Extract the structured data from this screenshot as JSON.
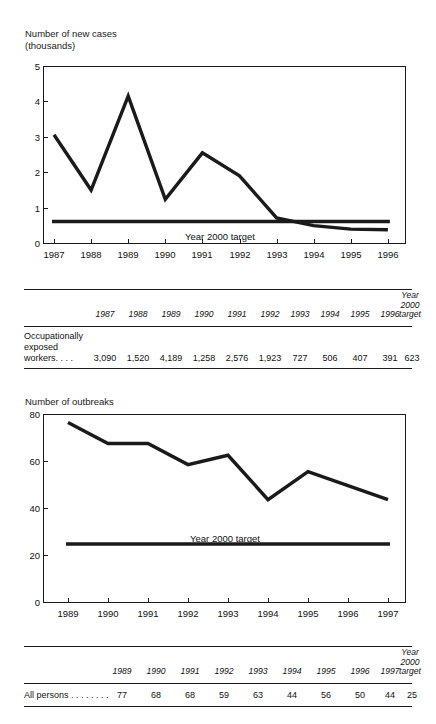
{
  "chart_data": [
    {
      "id": "new-cases",
      "type": "line",
      "title": "Number of new cases\n(thousands)",
      "ylabel": "Number of new cases (thousands)",
      "xlabel": "",
      "ylim": [
        0,
        5
      ],
      "yticks": [
        0,
        1,
        2,
        3,
        4,
        5
      ],
      "ytick_labels": [
        "0",
        "1",
        "2",
        "3",
        "4",
        "5"
      ],
      "categories": [
        "1987",
        "1988",
        "1989",
        "1990",
        "1991",
        "1992",
        "1993",
        "1994",
        "1995",
        "1996"
      ],
      "grid": false,
      "legend": "none",
      "series": [
        {
          "name": "Occupationally exposed workers",
          "values": [
            3.09,
            1.52,
            4.189,
            1.258,
            2.576,
            1.923,
            0.727,
            0.506,
            0.407,
            0.391
          ]
        },
        {
          "name": "Year 2000 target",
          "constant": 0.623,
          "annotation": "Year 2000 target"
        }
      ]
    },
    {
      "id": "outbreaks",
      "type": "line",
      "title": "Number of outbreaks",
      "ylabel": "Number of outbreaks",
      "xlabel": "",
      "ylim": [
        0,
        80
      ],
      "yticks": [
        0,
        20,
        40,
        60,
        80
      ],
      "ytick_labels": [
        "0",
        "20",
        "40",
        "60",
        "80"
      ],
      "categories": [
        "1989",
        "1990",
        "1991",
        "1992",
        "1993",
        "1994",
        "1995",
        "1996",
        "1997"
      ],
      "grid": false,
      "legend": "none",
      "series": [
        {
          "name": "All persons",
          "values": [
            77,
            68,
            68,
            59,
            63,
            44,
            56,
            50,
            44
          ]
        },
        {
          "name": "Year 2000 target",
          "constant": 25,
          "annotation": "Year 2000 target"
        }
      ]
    }
  ],
  "chart_one": {
    "title_line1": "Number of new cases",
    "title_line2": "(thousands)",
    "ytick_labels": [
      "5",
      "4",
      "3",
      "2",
      "1",
      "0"
    ],
    "xtick_labels": [
      "1987",
      "1988",
      "1989",
      "1990",
      "1991",
      "1992",
      "1993",
      "1994",
      "1995",
      "1996"
    ],
    "target_label": "Year 2000 target"
  },
  "table_one": {
    "headers": [
      "1987",
      "1988",
      "1989",
      "1990",
      "1991",
      "1992",
      "1993",
      "1994",
      "1995",
      "1996"
    ],
    "target_header": "Year\n2000\ntarget",
    "row_label": "Occupationally\n  exposed\n  workers. . . .",
    "values": [
      "3,090",
      "1,520",
      "4,189",
      "1,258",
      "2,576",
      "1,923",
      "727",
      "506",
      "407",
      "391"
    ],
    "target_value": "623"
  },
  "chart_two": {
    "title_line1": "Number of outbreaks",
    "ytick_labels": [
      "80",
      "60",
      "40",
      "20",
      "0"
    ],
    "xtick_labels": [
      "1989",
      "1990",
      "1991",
      "1992",
      "1993",
      "1994",
      "1995",
      "1996",
      "1997"
    ],
    "target_label": "Year 2000 target"
  },
  "table_two": {
    "headers": [
      "1989",
      "1990",
      "1991",
      "1992",
      "1993",
      "1994",
      "1995",
      "1996",
      "1997"
    ],
    "target_header": "Year\n2000\ntarget",
    "row_label": "All persons . . . . . . . .",
    "values": [
      "77",
      "68",
      "68",
      "59",
      "63",
      "44",
      "56",
      "50",
      "44"
    ],
    "target_value": "25"
  },
  "colors": {
    "line": "#1a1a1a",
    "axis": "#1a1a1a",
    "text": "#111111",
    "background": "#ffffff"
  }
}
